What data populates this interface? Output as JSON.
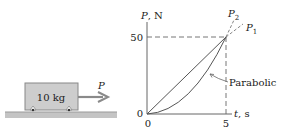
{
  "block": {
    "mass_label": "10 kg",
    "force_label": "P"
  },
  "graph": {
    "y_axis_label": "P, N",
    "x_axis_label": "t, s",
    "y_tick_top": "50",
    "y_tick_origin": "0",
    "x_tick_origin": "0",
    "x_tick_end": "5",
    "line_label_1": "P",
    "line_label_1_sub": "1",
    "line_label_2": "P",
    "line_label_2_sub": "2",
    "curve_annotation": "Parabolic"
  },
  "colors": {
    "block_fill": "#c8c8c8",
    "block_stroke": "#777777",
    "ground": "#bdbdbd",
    "arrow": "#8a8a8a",
    "axis": "#666666",
    "curve": "#555555"
  }
}
